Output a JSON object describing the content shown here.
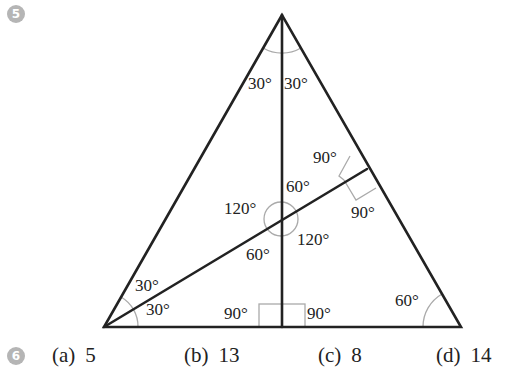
{
  "question5": {
    "number": "5",
    "diagram": {
      "shape": "equilateral triangle with altitude and median",
      "vertices": {
        "apex": [
          282,
          15
        ],
        "bottom_left": [
          104,
          327
        ],
        "bottom_right": [
          461,
          327
        ]
      },
      "angle_labels": {
        "apex_left": "30°",
        "apex_right": "30°",
        "right_angle_upper": "90°",
        "right_angle_lower": "90°",
        "intersection_top": "60°",
        "intersection_left": "120°",
        "intersection_right": "120°",
        "intersection_bottom": "60°",
        "bottom_left_upper": "30°",
        "bottom_left_lower": "30°",
        "foot_left": "90°",
        "foot_right": "90°",
        "bottom_right": "60°"
      }
    }
  },
  "question6": {
    "number": "6",
    "answers": [
      {
        "label": "(a)",
        "value": "5"
      },
      {
        "label": "(b)",
        "value": "13"
      },
      {
        "label": "(c)",
        "value": "8"
      },
      {
        "label": "(d)",
        "value": "14"
      }
    ]
  }
}
